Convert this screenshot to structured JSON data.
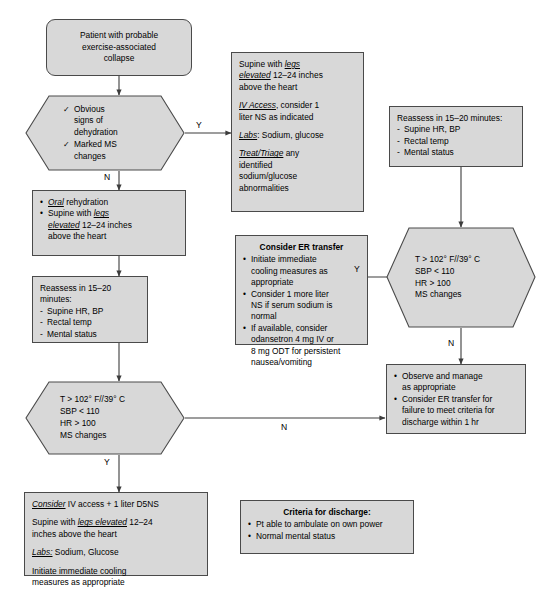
{
  "diagram": {
    "colors": {
      "node_fill": "#d8d8d8",
      "node_border": "#4a4a4a",
      "background": "#ffffff",
      "text": "#000000"
    }
  },
  "nodes": {
    "start": {
      "name": "start-node",
      "lines": [
        "Patient with probable",
        "exercise-associated",
        "collapse"
      ]
    },
    "decision_dehydration": {
      "name": "decision-dehydration",
      "items": [
        "Obvious signs of dehydration",
        "Marked MS changes"
      ],
      "lines": [
        "Obvious",
        "signs of",
        "dehydration",
        "Marked MS",
        "changes"
      ]
    },
    "oral_rehydration": {
      "name": "oral-rehydration-box",
      "items": [
        "Oral rehydration",
        "Supine with legs elevated 12–24 inches above the heart"
      ]
    },
    "reassess_left": {
      "name": "reassess-left-box",
      "heading": "Reassess in 15–20 minutes:",
      "items": [
        "Supine HR, BP",
        "Rectal temp",
        "Mental status"
      ]
    },
    "decision_vitals_left": {
      "name": "decision-vitals-left",
      "lines": [
        "T > 102° F//39° C",
        "SBP < 110",
        "HR > 100",
        "MS changes"
      ]
    },
    "consider_iv": {
      "name": "consider-iv-access-box",
      "paragraphs": [
        "Consider IV access + 1 liter D5NS",
        "Supine with legs elevated 12–24 inches above the heart",
        "Labs: Sodium, Glucose",
        "Initiate immediate cooling measures as appropriate"
      ]
    },
    "supine_treat": {
      "name": "supine-treat-box",
      "paragraphs": [
        "Supine with legs elevated 12–24 inches above the heart",
        "IV Access, consider 1 liter NS as indicated",
        "Labs: Sodium, glucose",
        "Treat/Triage any identified sodium/glucose abnormalities"
      ]
    },
    "consider_er": {
      "name": "consider-er-transfer-box",
      "heading": "Consider ER transfer",
      "items": [
        "Initiate immediate cooling measures as appropriate",
        "Consider 1 more liter NS if serum sodium is normal",
        "If available, consider odansetron 4 mg IV or 8 mg ODT for persistent nausea/vomiting"
      ]
    },
    "reassess_right": {
      "name": "reassess-right-box",
      "heading": "Reassess in 15–20 minutes:",
      "items": [
        "Supine HR, BP",
        "Rectal temp",
        "Mental status"
      ]
    },
    "decision_vitals_right": {
      "name": "decision-vitals-right",
      "lines": [
        "T > 102° F//39° C",
        "SBP < 110",
        "HR > 100",
        "MS changes"
      ]
    },
    "observe_manage": {
      "name": "observe-and-manage-box",
      "items": [
        "Observe and manage as appropriate",
        "Consider ER transfer for failure to meet criteria for discharge within 1 hr"
      ]
    },
    "criteria_discharge": {
      "name": "criteria-for-discharge-box",
      "heading": "Criteria for discharge:",
      "items": [
        "Pt able to ambulate on own power",
        "Normal mental status"
      ]
    }
  },
  "edges": {
    "yes_dehydration": "Y",
    "no_dehydration": "N",
    "yes_vitals_left": "Y",
    "no_vitals_left": "N",
    "yes_vitals_right": "Y",
    "no_vitals_right": "N"
  }
}
